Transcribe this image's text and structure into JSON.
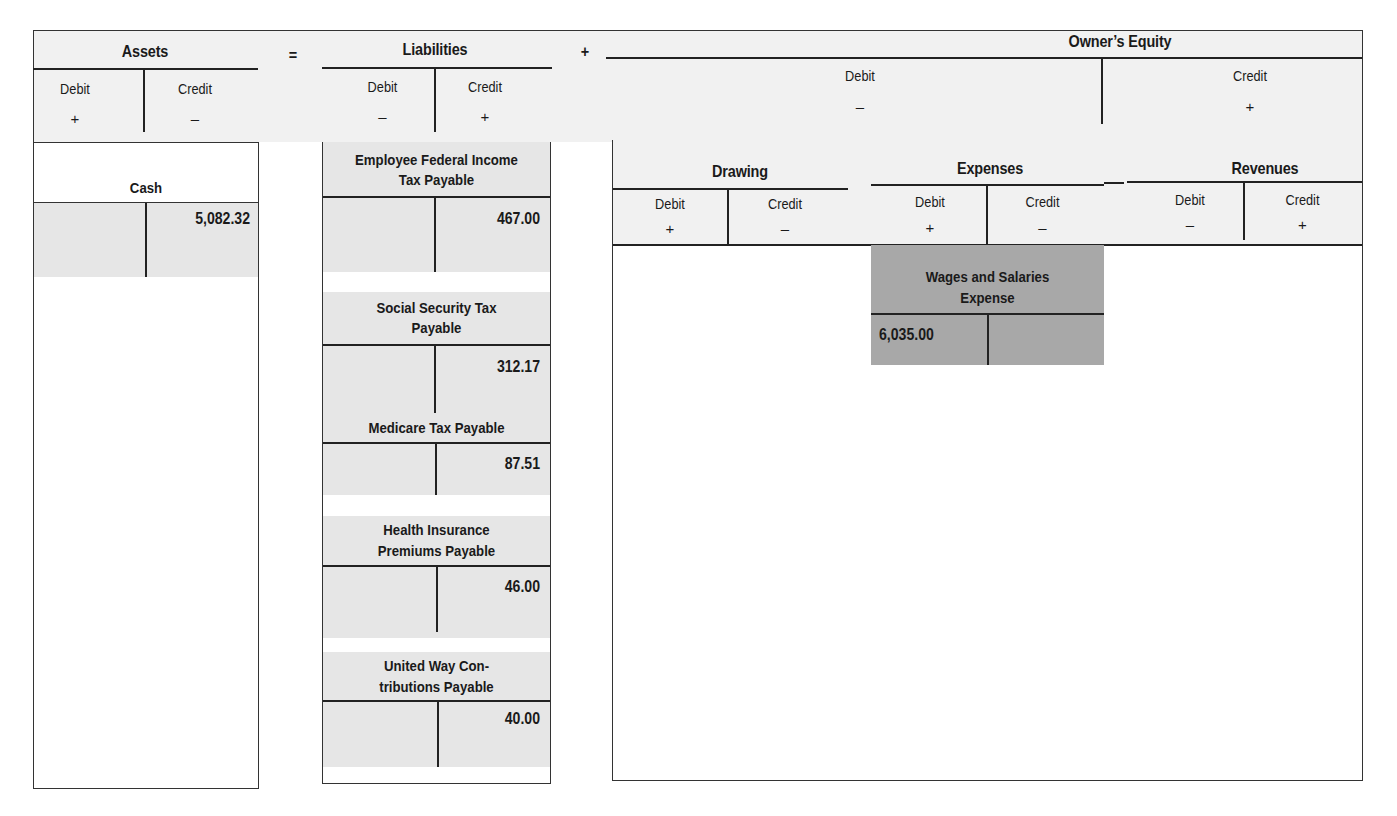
{
  "equation": {
    "assets": {
      "title": "Assets",
      "debit_label": "Debit",
      "debit_sign": "+",
      "credit_label": "Credit",
      "credit_sign": "–"
    },
    "equals": "=",
    "liabilities": {
      "title": "Liabilities",
      "debit_label": "Debit",
      "debit_sign": "–",
      "credit_label": "Credit",
      "credit_sign": "+"
    },
    "plus": "+",
    "owners_equity": {
      "title": "Owner’s Equity",
      "debit_label": "Debit",
      "debit_sign": "–",
      "credit_label": "Credit",
      "credit_sign": "+"
    }
  },
  "equity_sub": {
    "drawing": {
      "title": "Drawing",
      "debit_label": "Debit",
      "debit_sign": "+",
      "credit_label": "Credit",
      "credit_sign": "–"
    },
    "expenses": {
      "title": "Expenses",
      "debit_label": "Debit",
      "debit_sign": "+",
      "credit_label": "Credit",
      "credit_sign": "–"
    },
    "revenues": {
      "title": "Revenues",
      "debit_label": "Debit",
      "debit_sign": "–",
      "credit_label": "Credit",
      "credit_sign": "+"
    }
  },
  "accounts": {
    "cash": {
      "title": "Cash",
      "debit": "",
      "credit": "5,082.32"
    },
    "fed_income_tax": {
      "title_line1": "Employee Federal Income",
      "title_line2": "Tax Payable",
      "debit": "",
      "credit": "467.00"
    },
    "social_security": {
      "title_line1": "Social Security Tax",
      "title_line2": "Payable",
      "debit": "",
      "credit": "312.17"
    },
    "medicare": {
      "title_line1": "Medicare Tax Payable",
      "debit": "",
      "credit": "87.51"
    },
    "health_insurance": {
      "title_line1": "Health Insurance",
      "title_line2": "Premiums Payable",
      "debit": "",
      "credit": "46.00"
    },
    "united_way": {
      "title_line1": "United Way Con-",
      "title_line2": "tributions Payable",
      "debit": "",
      "credit": "40.00"
    },
    "wages_salaries": {
      "title_line1": "Wages and Salaries",
      "title_line2": "Expense",
      "debit": "6,035.00",
      "credit": ""
    }
  }
}
